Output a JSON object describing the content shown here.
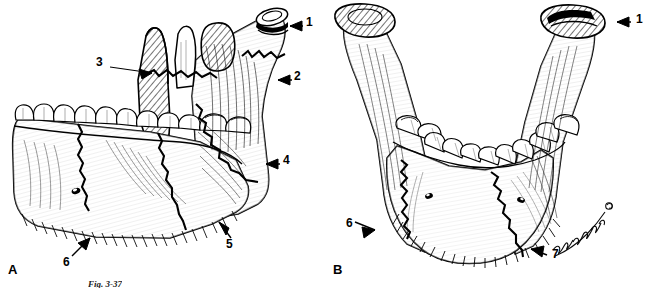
{
  "figure": {
    "caption": "Fig. 3-37",
    "background_color": "#ffffff",
    "ink_color": "#000000",
    "width": 651,
    "height": 288
  },
  "panels": [
    {
      "id": "a",
      "letter": "A",
      "view": "lateral oblique view of mandible",
      "callouts": [
        {
          "number": "1",
          "x": 308,
          "y": 22,
          "arrow": "left",
          "target": "condylar head / condyle"
        },
        {
          "number": "2",
          "x": 296,
          "y": 76,
          "arrow": "left",
          "target": "condylar neck / subcondylar region"
        },
        {
          "number": "3",
          "x": 99,
          "y": 62,
          "arrow": "right",
          "target": "coronoid process / sigmoid notch"
        },
        {
          "number": "4",
          "x": 285,
          "y": 160,
          "arrow": "left",
          "target": "ramus"
        },
        {
          "number": "5",
          "x": 229,
          "y": 243,
          "arrow": "up-left",
          "target": "angle of mandible"
        },
        {
          "number": "6",
          "x": 66,
          "y": 261,
          "arrow": "up-right",
          "target": "body / parasymphysis"
        }
      ]
    },
    {
      "id": "b",
      "letter": "B",
      "view": "anterior (frontal) view of mandible",
      "callouts": [
        {
          "number": "1",
          "x": 636,
          "y": 19,
          "arrow": "left",
          "target": "condylar head / condyle"
        },
        {
          "number": "6",
          "x": 346,
          "y": 224,
          "arrow": "right",
          "target": "body / parasymphysis"
        },
        {
          "number": "7",
          "x": 552,
          "y": 253,
          "arrow": "left",
          "target": "symphysis / midline"
        }
      ]
    }
  ],
  "artist_signature": {
    "present": true,
    "legible": false,
    "description": "cursive artist signature along right lower border of panel B"
  }
}
